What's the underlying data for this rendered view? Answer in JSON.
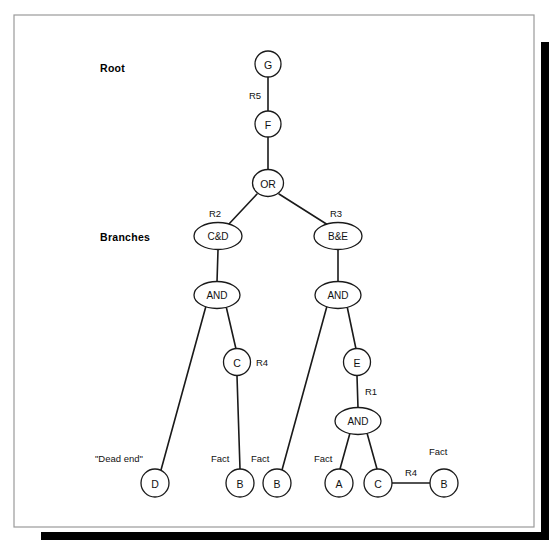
{
  "figure": {
    "background": "#ffffff",
    "ink_color": "#1a1a1a",
    "frame_color": "#9a9a9a",
    "shadow_color": "#000000"
  },
  "side_labels": [
    {
      "id": "root",
      "text": "Root",
      "x": 100,
      "y": 68
    },
    {
      "id": "branches",
      "text": "Branches",
      "x": 100,
      "y": 237
    }
  ],
  "nodes": [
    {
      "id": "G",
      "label": "G",
      "x": 268,
      "y": 64,
      "rx": 13,
      "ry": 13
    },
    {
      "id": "F",
      "label": "F",
      "x": 268,
      "y": 124,
      "rx": 13,
      "ry": 13
    },
    {
      "id": "OR",
      "label": "OR",
      "x": 268,
      "y": 183,
      "rx": 15.5,
      "ry": 13.5
    },
    {
      "id": "CD",
      "label": "C&D",
      "x": 218,
      "y": 236,
      "rx": 24,
      "ry": 13.5
    },
    {
      "id": "BE",
      "label": "B&E",
      "x": 338,
      "y": 236,
      "rx": 24,
      "ry": 13.5
    },
    {
      "id": "AND_L",
      "label": "AND",
      "x": 217,
      "y": 295,
      "rx": 23,
      "ry": 13.5
    },
    {
      "id": "AND_R",
      "label": "AND",
      "x": 338,
      "y": 295,
      "rx": 23,
      "ry": 13.5
    },
    {
      "id": "C_MID",
      "label": "C",
      "x": 237,
      "y": 362,
      "rx": 13.5,
      "ry": 13.5
    },
    {
      "id": "E",
      "label": "E",
      "x": 357,
      "y": 362,
      "rx": 13.5,
      "ry": 13.5
    },
    {
      "id": "AND_BOT",
      "label": "AND",
      "x": 358,
      "y": 421,
      "rx": 23,
      "ry": 13.5
    },
    {
      "id": "D",
      "label": "D",
      "x": 155,
      "y": 483,
      "rx": 14,
      "ry": 14
    },
    {
      "id": "B_L",
      "label": "B",
      "x": 240,
      "y": 483,
      "rx": 14,
      "ry": 14
    },
    {
      "id": "B_M",
      "label": "B",
      "x": 277,
      "y": 483,
      "rx": 14,
      "ry": 14
    },
    {
      "id": "A",
      "label": "A",
      "x": 339,
      "y": 483,
      "rx": 14,
      "ry": 14
    },
    {
      "id": "C_BOT",
      "label": "C",
      "x": 378,
      "y": 483,
      "rx": 14,
      "ry": 14
    },
    {
      "id": "B_R",
      "label": "B",
      "x": 444,
      "y": 483,
      "rx": 14,
      "ry": 14
    }
  ],
  "edges": [
    {
      "id": "G-F",
      "from": "G",
      "to": "F",
      "x1": 268,
      "y1": 77,
      "x2": 268,
      "y2": 111
    },
    {
      "id": "F-OR",
      "from": "F",
      "to": "OR",
      "x1": 268,
      "y1": 137,
      "x2": 268,
      "y2": 170
    },
    {
      "id": "OR-CD",
      "from": "OR",
      "to": "CD",
      "x1": 257,
      "y1": 194,
      "x2": 228,
      "y2": 225
    },
    {
      "id": "OR-BE",
      "from": "OR",
      "to": "BE",
      "x1": 279,
      "y1": 194,
      "x2": 328,
      "y2": 225
    },
    {
      "id": "CD-ANDL",
      "from": "CD",
      "to": "AND_L",
      "x1": 218,
      "y1": 250,
      "x2": 217,
      "y2": 282
    },
    {
      "id": "BE-ANDR",
      "from": "BE",
      "to": "AND_R",
      "x1": 338,
      "y1": 250,
      "x2": 338,
      "y2": 282
    },
    {
      "id": "ANDL-D",
      "from": "AND_L",
      "to": "D",
      "x1": 206,
      "y1": 306,
      "x2": 161,
      "y2": 470
    },
    {
      "id": "ANDL-CMID",
      "from": "AND_L",
      "to": "C_MID",
      "x1": 226,
      "y1": 306,
      "x2": 236,
      "y2": 349
    },
    {
      "id": "CMID-BL",
      "from": "C_MID",
      "to": "B_L",
      "x1": 237,
      "y1": 376,
      "x2": 240,
      "y2": 469
    },
    {
      "id": "ANDR-BM",
      "from": "AND_R",
      "to": "B_M",
      "x1": 327,
      "y1": 306,
      "x2": 282,
      "y2": 470
    },
    {
      "id": "ANDR-E",
      "from": "AND_R",
      "to": "E",
      "x1": 347,
      "y1": 306,
      "x2": 356,
      "y2": 349
    },
    {
      "id": "E-ANDBOT",
      "from": "E",
      "to": "AND_BOT",
      "x1": 357,
      "y1": 376,
      "x2": 358,
      "y2": 408
    },
    {
      "id": "ANDBOT-A",
      "from": "AND_BOT",
      "to": "A",
      "x1": 350,
      "y1": 433,
      "x2": 340,
      "y2": 469
    },
    {
      "id": "ANDBOT-CBOT",
      "from": "AND_BOT",
      "to": "C_BOT",
      "x1": 367,
      "y1": 433,
      "x2": 377,
      "y2": 469
    },
    {
      "id": "CBOT-BR",
      "from": "C_BOT",
      "to": "B_R",
      "x1": 392,
      "y1": 483,
      "x2": 430,
      "y2": 483
    }
  ],
  "edge_labels": [
    {
      "id": "R5",
      "text": "R5",
      "x": 255,
      "y": 95,
      "anchor": "middle"
    },
    {
      "id": "R2",
      "text": "R2",
      "x": 215,
      "y": 213,
      "anchor": "middle"
    },
    {
      "id": "R3",
      "text": "R3",
      "x": 336,
      "y": 213,
      "anchor": "middle"
    },
    {
      "id": "R4-mid",
      "text": "R4",
      "x": 262,
      "y": 362,
      "anchor": "start"
    },
    {
      "id": "R1",
      "text": "R1",
      "x": 371,
      "y": 391,
      "anchor": "start"
    },
    {
      "id": "R4-bot",
      "text": "R4",
      "x": 411,
      "y": 472,
      "anchor": "middle"
    }
  ],
  "annotations": [
    {
      "id": "dead-end",
      "text": "\"Dead end\"",
      "x": 95,
      "y": 458,
      "anchor": "start"
    },
    {
      "id": "fact-bl",
      "text": "Fact",
      "x": 211,
      "y": 458,
      "anchor": "start"
    },
    {
      "id": "fact-bm",
      "text": "Fact",
      "x": 251,
      "y": 458,
      "anchor": "start"
    },
    {
      "id": "fact-a",
      "text": "Fact",
      "x": 314,
      "y": 458,
      "anchor": "start"
    },
    {
      "id": "fact-br",
      "text": "Fact",
      "x": 429,
      "y": 451,
      "anchor": "start"
    }
  ],
  "frame": {
    "x": 14,
    "y": 15,
    "width": 520,
    "height": 512,
    "shadow_right": {
      "x": 541,
      "y": 42,
      "width": 8,
      "height": 498
    },
    "shadow_bottom": {
      "x": 41,
      "y": 532,
      "width": 508,
      "height": 8
    }
  }
}
